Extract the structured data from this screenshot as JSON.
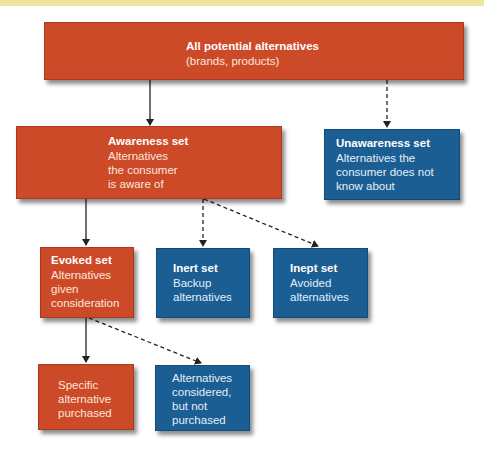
{
  "diagram": {
    "colors": {
      "red": "#cd4a28",
      "blue": "#1b5e94",
      "arrow": "#222222",
      "top_band": "#ece79c"
    },
    "nodes": {
      "all": {
        "title": "All potential alternatives",
        "body": [
          "(brands, products)"
        ],
        "color": "red"
      },
      "awareness": {
        "title": "Awareness set",
        "body": [
          "Alternatives",
          "the consumer",
          "is aware of"
        ],
        "color": "red"
      },
      "unawareness": {
        "title": "Unawareness set",
        "body": [
          "Alternatives the",
          "consumer does not",
          "know about"
        ],
        "color": "blue"
      },
      "evoked": {
        "title": "Evoked set",
        "body": [
          "Alternatives",
          "given",
          "consideration"
        ],
        "color": "red"
      },
      "inert": {
        "title": "Inert set",
        "body": [
          "Backup",
          "alternatives"
        ],
        "color": "blue"
      },
      "inept": {
        "title": "Inept set",
        "body": [
          "Avoided",
          "alternatives"
        ],
        "color": "blue"
      },
      "purchased": {
        "body": [
          "Specific",
          "alternative",
          "purchased"
        ],
        "color": "red"
      },
      "not_purchased": {
        "body": [
          "Alternatives",
          "considered,",
          "but not",
          "purchased"
        ],
        "color": "blue"
      }
    },
    "edges": [
      {
        "from": "all",
        "to": "awareness",
        "style": "solid"
      },
      {
        "from": "all",
        "to": "unawareness",
        "style": "dashed"
      },
      {
        "from": "awareness",
        "to": "evoked",
        "style": "solid"
      },
      {
        "from": "awareness",
        "to": "inert",
        "style": "dashed"
      },
      {
        "from": "awareness",
        "to": "inept",
        "style": "dashed"
      },
      {
        "from": "evoked",
        "to": "purchased",
        "style": "solid"
      },
      {
        "from": "evoked",
        "to": "not_purchased",
        "style": "dashed"
      }
    ]
  }
}
